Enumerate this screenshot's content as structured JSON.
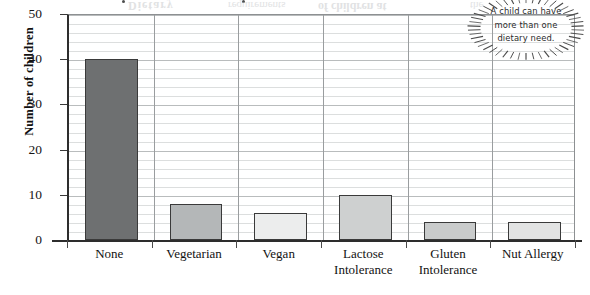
{
  "chart_data": {
    "type": "bar",
    "title": "",
    "xlabel": "",
    "ylabel": "Number of children",
    "categories": [
      "None",
      "Vegetarian",
      "Vegan",
      "Lactose Intolerance",
      "Gluten Intolerance",
      "Nut Allergy"
    ],
    "category_lines": [
      [
        "None"
      ],
      [
        "Vegetarian"
      ],
      [
        "Vegan"
      ],
      [
        "Lactose",
        "Intolerance"
      ],
      [
        "Gluten",
        "Intolerance"
      ],
      [
        "Nut Allergy"
      ]
    ],
    "values": [
      40,
      8,
      6,
      10,
      4,
      4
    ],
    "bar_colors": [
      "#6e7071",
      "#b4b7b8",
      "#eceded",
      "#ced0d0",
      "#c9cbcb",
      "#e2e3e3"
    ],
    "bar_border_color": "#3a3a3a",
    "ylim": [
      0,
      50
    ],
    "y_ticks": [
      0,
      10,
      20,
      30,
      40,
      50
    ],
    "y_minor_tick_step": 2,
    "grid": true,
    "grid_major_color": "#b9bcbd",
    "grid_minor_color": "#dcdede",
    "legend": "none",
    "legend_position": ""
  },
  "annotation": {
    "name": "starburst-callout",
    "lines": [
      "A child can have",
      "more than one",
      "dietary need."
    ]
  },
  "bleed_through": {
    "lines": [
      "Dietary",
      "requirements",
      "of children at",
      "the",
      "Building",
      "a picture",
      "of the data",
      "survey"
    ]
  }
}
